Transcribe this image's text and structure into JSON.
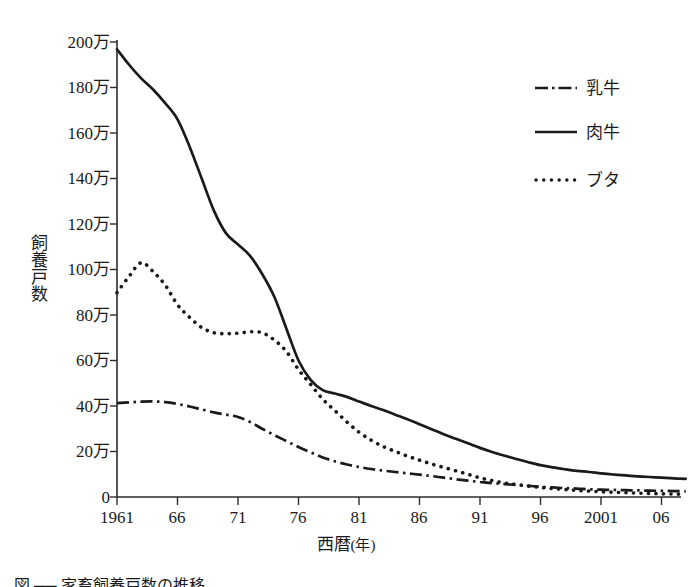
{
  "chart_data": {
    "type": "line",
    "title": "",
    "xlabel": "西暦(年)",
    "ylabel": "飼養戸数",
    "xlim": [
      1961,
      2008
    ],
    "ylim": [
      0,
      2000000
    ],
    "grid": false,
    "legend_position": "top-right",
    "y_tick_labels": [
      "200万",
      "180万",
      "160万",
      "140万",
      "120万",
      "100万",
      "80万",
      "60万",
      "40万",
      "20万",
      "0"
    ],
    "y_tick_values": [
      2000000,
      1800000,
      1600000,
      1400000,
      1200000,
      1000000,
      800000,
      600000,
      400000,
      200000,
      0
    ],
    "x_tick_labels": [
      "1961",
      "66",
      "71",
      "76",
      "81",
      "86",
      "91",
      "96",
      "2001",
      "06"
    ],
    "x_tick_values": [
      1961,
      1966,
      1971,
      1976,
      1981,
      1986,
      1991,
      1996,
      2001,
      2006
    ],
    "x": [
      1961,
      1962,
      1963,
      1964,
      1965,
      1966,
      1967,
      1968,
      1969,
      1970,
      1971,
      1972,
      1973,
      1974,
      1975,
      1976,
      1977,
      1978,
      1979,
      1980,
      1981,
      1982,
      1983,
      1984,
      1985,
      1986,
      1987,
      1988,
      1989,
      1990,
      1991,
      1992,
      1993,
      1994,
      1995,
      1996,
      1997,
      1998,
      1999,
      2000,
      2001,
      2002,
      2003,
      2004,
      2005,
      2006,
      2007,
      2008
    ],
    "series": [
      {
        "name": "乳牛",
        "style": "dash-dot",
        "color": "#1a1a1a",
        "values": [
          413000,
          416000,
          419000,
          420000,
          417000,
          409000,
          398000,
          385000,
          372000,
          362000,
          352000,
          330000,
          300000,
          272000,
          246000,
          220000,
          196000,
          174000,
          157000,
          143000,
          132000,
          123000,
          116000,
          110000,
          104000,
          98000,
          92000,
          85000,
          78000,
          72000,
          66000,
          61000,
          57000,
          53000,
          49000,
          45000,
          42000,
          39000,
          37000,
          34000,
          32000,
          31000,
          30000,
          29000,
          28000,
          27000,
          26000,
          25000
        ]
      },
      {
        "name": "肉牛",
        "style": "solid",
        "color": "#1a1a1a",
        "values": [
          1968000,
          1900000,
          1840000,
          1790000,
          1730000,
          1660000,
          1540000,
          1400000,
          1260000,
          1160000,
          1110000,
          1060000,
          980000,
          880000,
          740000,
          600000,
          515000,
          470000,
          455000,
          440000,
          420000,
          400000,
          382000,
          362000,
          342000,
          320000,
          298000,
          276000,
          256000,
          236000,
          216000,
          198000,
          182000,
          167000,
          153000,
          140000,
          130000,
          122000,
          115000,
          110000,
          104000,
          99000,
          95000,
          91000,
          88000,
          85000,
          82000,
          80000
        ]
      },
      {
        "name": "ブタ",
        "style": "dotted",
        "color": "#1a1a1a",
        "values": [
          898000,
          970000,
          1030000,
          990000,
          930000,
          845000,
          790000,
          745000,
          722000,
          718000,
          720000,
          726000,
          722000,
          690000,
          640000,
          560000,
          495000,
          430000,
          380000,
          330000,
          285000,
          250000,
          222000,
          200000,
          180000,
          162000,
          145000,
          130000,
          115000,
          100000,
          84000,
          72000,
          62000,
          55000,
          48000,
          42000,
          37000,
          33000,
          29000,
          26000,
          23000,
          21000,
          19000,
          17000,
          16000,
          14000,
          13000,
          12000
        ]
      }
    ]
  },
  "axis": {
    "y_title": "飼養戸数",
    "x_title_main": "西暦",
    "x_title_unit": "(年)"
  },
  "legend": {
    "items": [
      {
        "label": "乳牛",
        "style": "dash-dot"
      },
      {
        "label": "肉牛",
        "style": "solid"
      },
      {
        "label": "ブタ",
        "style": "dotted"
      }
    ]
  },
  "caption": {
    "text": "図 ── 家畜飼養戸数の推移"
  },
  "colors": {
    "ink": "#1a1a1a",
    "axis": "#2b2b2b",
    "background": "#ffffff"
  }
}
